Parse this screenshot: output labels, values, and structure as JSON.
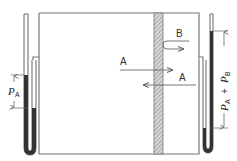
{
  "diagram": {
    "title": "",
    "labels": {
      "pressure_left": "P",
      "pressure_left_sub": "A",
      "pressure_right_a": "P",
      "pressure_right_a_sub": "A",
      "plus": "+",
      "pressure_right_b": "P",
      "pressure_right_b_sub": "B",
      "arrow_a_forward": "A",
      "arrow_a_backward": "A",
      "arrow_b": "B"
    },
    "components": [
      "left-manometer",
      "container",
      "membrane",
      "right-manometer"
    ],
    "colors": {
      "line": "#555555",
      "fluid": "#333333",
      "membrane_hatch": "#888888"
    }
  }
}
